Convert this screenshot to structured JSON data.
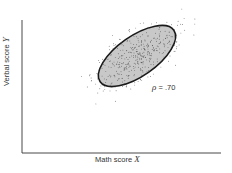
{
  "chart_data": {
    "type": "scatter",
    "title": "",
    "xlabel": "Math score",
    "xlabel_var": "X",
    "ylabel": "Verbal score",
    "ylabel_var": "Y",
    "annotation": {
      "symbol": "ρ",
      "text": "= .70"
    },
    "correlation": 0.7,
    "grid": false,
    "legend": "none",
    "ticks": "none",
    "ellipse": {
      "center": [
        137,
        56
      ],
      "rx": 45,
      "ry": 20,
      "rotation_deg": -35,
      "fill": "#c8c8c8",
      "stroke": "#222222"
    },
    "point_count_approx": 400
  },
  "colors": {
    "axis": "#333333",
    "points": "#444444",
    "ellipse_fill": "#c8c8c8",
    "ellipse_stroke": "#1a1a1a"
  }
}
